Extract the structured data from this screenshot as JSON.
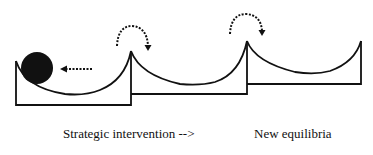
{
  "diagram": {
    "captions": {
      "left": "Strategic intervention -->",
      "right": "New equilibria"
    },
    "elements": {
      "ball": "ball-in-basin",
      "push_arrow": "dotted-left-arrow",
      "jump_arrows": [
        "curved-dotted-arrow",
        "curved-dotted-arrow"
      ],
      "basins": [
        "basin-1",
        "basin-2",
        "basin-3"
      ]
    },
    "colors": {
      "ink": "#111111",
      "background": "#ffffff"
    }
  }
}
